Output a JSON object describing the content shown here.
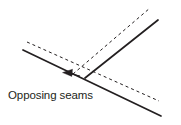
{
  "figure": {
    "background_color": "#ffffff",
    "stroke_color": "#231f20",
    "label": {
      "text": "Opposing seams",
      "x": 8,
      "y": 99,
      "font_size": 11.5,
      "color": "#231f20"
    },
    "annotation": {
      "arrow_name": "leader-arrow",
      "points_to": "seam-vertex",
      "direction": "left",
      "tip": {
        "x": 63,
        "y": 73
      },
      "tail": {
        "x": 80,
        "y": 76
      }
    },
    "geometry": {
      "vertex": {
        "x": 85,
        "y": 78
      },
      "seam_lines": [
        {
          "name": "descending-seam",
          "style": "solid",
          "from": {
            "x": 23,
            "y": 50
          },
          "to": {
            "x": 161,
            "y": 116
          },
          "width": 1.6
        },
        {
          "name": "ascending-seam",
          "style": "solid",
          "from": {
            "x": 85,
            "y": 78
          },
          "to": {
            "x": 158,
            "y": 20
          },
          "width": 1.6
        }
      ],
      "offset_lines": [
        {
          "name": "descending-seam-offset",
          "style": "dashed",
          "from": {
            "x": 27,
            "y": 42
          },
          "to": {
            "x": 159,
            "y": 101
          },
          "width": 1.0,
          "dash": "3 3"
        },
        {
          "name": "ascending-seam-offset",
          "style": "dashed",
          "from": {
            "x": 73,
            "y": 74
          },
          "to": {
            "x": 150,
            "y": 8
          },
          "width": 1.0,
          "dash": "3 3"
        }
      ]
    }
  }
}
